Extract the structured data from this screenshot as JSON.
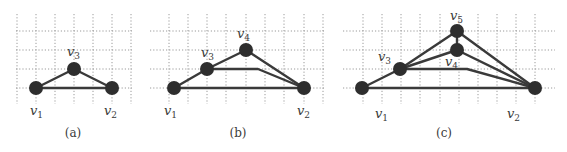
{
  "figure": {
    "panels": [
      {
        "id": "a",
        "caption": "(a)",
        "caption_pos": [
          73,
          137
        ],
        "grid": {
          "x_lines": [
            17,
            36,
            55,
            74,
            93,
            112,
            131
          ],
          "y_lines": [
            31,
            50,
            69,
            88
          ],
          "x_range": [
            16,
            132
          ],
          "y_range": [
            14,
            104
          ]
        },
        "nodes": [
          {
            "name": "v",
            "sub": "1",
            "x": 36,
            "y": 88,
            "label_x": 30,
            "label_y": 115
          },
          {
            "name": "v",
            "sub": "2",
            "x": 112,
            "y": 88,
            "label_x": 104,
            "label_y": 115
          },
          {
            "name": "v",
            "sub": "3",
            "x": 74,
            "y": 69,
            "label_x": 67,
            "label_y": 56
          }
        ],
        "edges": [
          [
            [
              36,
              88
            ],
            [
              74,
              69
            ]
          ],
          [
            [
              74,
              69
            ],
            [
              112,
              88
            ]
          ],
          [
            [
              36,
              88
            ],
            [
              112,
              88
            ]
          ]
        ]
      },
      {
        "id": "b",
        "caption": "(b)",
        "caption_pos": [
          238,
          137
        ],
        "grid": {
          "x_lines": [
            169,
            188,
            207,
            226,
            246,
            265,
            284,
            304,
            323
          ],
          "y_lines": [
            31,
            50,
            69,
            88
          ],
          "x_range": [
            150,
            324
          ],
          "y_range": [
            14,
            104
          ]
        },
        "nodes": [
          {
            "name": "v",
            "sub": "1",
            "x": 174,
            "y": 88,
            "label_x": 164,
            "label_y": 115
          },
          {
            "name": "v",
            "sub": "2",
            "x": 304,
            "y": 88,
            "label_x": 297,
            "label_y": 115
          },
          {
            "name": "v",
            "sub": "3",
            "x": 207,
            "y": 69,
            "label_x": 201,
            "label_y": 57
          },
          {
            "name": "v",
            "sub": "4",
            "x": 246,
            "y": 50,
            "label_x": 237,
            "label_y": 38
          }
        ],
        "edges": [
          [
            [
              174,
              88
            ],
            [
              207,
              69
            ]
          ],
          [
            [
              207,
              69
            ],
            [
              246,
              50
            ]
          ],
          [
            [
              246,
              50
            ],
            [
              304,
              88
            ]
          ],
          [
            [
              207,
              69
            ],
            [
              258,
              69
            ],
            [
              304,
              88
            ]
          ],
          [
            [
              174,
              88
            ],
            [
              304,
              88
            ]
          ]
        ]
      },
      {
        "id": "c",
        "caption": "(c)",
        "caption_pos": [
          444,
          137
        ],
        "grid": {
          "x_lines": [
            363,
            382,
            401,
            420,
            440,
            459,
            478,
            497,
            516,
            535
          ],
          "y_lines": [
            31,
            50,
            69,
            88
          ],
          "x_range": [
            343,
            555
          ],
          "y_range": [
            14,
            104
          ]
        },
        "nodes": [
          {
            "name": "v",
            "sub": "1",
            "x": 362,
            "y": 88,
            "label_x": 375,
            "label_y": 118
          },
          {
            "name": "v",
            "sub": "2",
            "x": 535,
            "y": 88,
            "label_x": 507,
            "label_y": 118
          },
          {
            "name": "v",
            "sub": "3",
            "x": 400,
            "y": 69,
            "label_x": 378,
            "label_y": 61
          },
          {
            "name": "v",
            "sub": "4",
            "x": 457,
            "y": 50,
            "label_x": 445,
            "label_y": 66
          },
          {
            "name": "v",
            "sub": "5",
            "x": 457,
            "y": 31,
            "label_x": 450,
            "label_y": 20
          }
        ],
        "edges": [
          [
            [
              362,
              88
            ],
            [
              400,
              69
            ]
          ],
          [
            [
              400,
              69
            ],
            [
              457,
              31
            ]
          ],
          [
            [
              400,
              69
            ],
            [
              457,
              50
            ]
          ],
          [
            [
              457,
              31
            ],
            [
              457,
              50
            ]
          ],
          [
            [
              457,
              31
            ],
            [
              535,
              88
            ]
          ],
          [
            [
              457,
              50
            ],
            [
              535,
              88
            ]
          ],
          [
            [
              400,
              69
            ],
            [
              467,
              69
            ],
            [
              535,
              88
            ]
          ],
          [
            [
              362,
              88
            ],
            [
              535,
              88
            ]
          ]
        ]
      }
    ],
    "style": {
      "node_radius": 7,
      "node_color": "#2e2e2e",
      "edge_color": "#3a3a3a",
      "grid_color": "#9a9a9a"
    }
  }
}
